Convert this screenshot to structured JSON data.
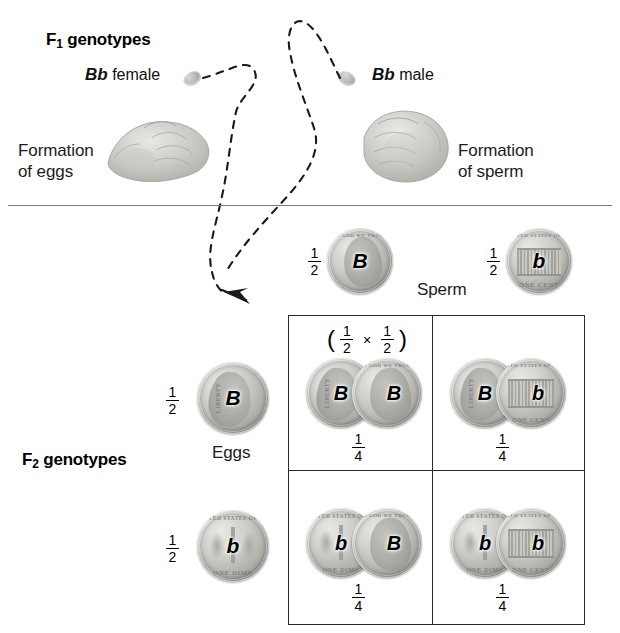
{
  "figure": {
    "type": "genetics-punnett-square",
    "title_f1": "F₁ genotypes",
    "title_f2": "F₂ genotypes"
  },
  "f1": {
    "label": "F₁ genotypes",
    "female": {
      "genotype": "Bb",
      "sex": "female",
      "caption": "Formation\nof eggs"
    },
    "male": {
      "genotype": "Bb",
      "sex": "male",
      "caption": "Formation\nof sperm"
    }
  },
  "gametes": {
    "sperm_label": "Sperm",
    "eggs_label": "Eggs",
    "sperm": [
      {
        "allele": "B",
        "probability_num": "1",
        "probability_den": "2",
        "coin": "penny-heads"
      },
      {
        "allele": "b",
        "probability_num": "1",
        "probability_den": "2",
        "coin": "penny-tails"
      }
    ],
    "eggs": [
      {
        "allele": "B",
        "probability_num": "1",
        "probability_den": "2",
        "coin": "dime-heads"
      },
      {
        "allele": "b",
        "probability_num": "1",
        "probability_den": "2",
        "coin": "dime-tails"
      }
    ]
  },
  "probability_expression": {
    "open": "(",
    "a_num": "1",
    "a_den": "2",
    "times": "×",
    "b_num": "1",
    "b_den": "2",
    "close": ")"
  },
  "f2": {
    "label": "F₂ genotypes",
    "cells": [
      {
        "row": 0,
        "col": 0,
        "egg_allele": "B",
        "sperm_allele": "B",
        "genotype": "BB",
        "egg_coin": "dime-heads",
        "sperm_coin": "penny-heads",
        "probability_num": "1",
        "probability_den": "4",
        "has_expression": true
      },
      {
        "row": 0,
        "col": 1,
        "egg_allele": "B",
        "sperm_allele": "b",
        "genotype": "Bb",
        "egg_coin": "dime-heads",
        "sperm_coin": "penny-tails",
        "probability_num": "1",
        "probability_den": "4",
        "has_expression": false
      },
      {
        "row": 1,
        "col": 0,
        "egg_allele": "b",
        "sperm_allele": "B",
        "genotype": "bB",
        "egg_coin": "dime-tails",
        "sperm_coin": "penny-heads",
        "probability_num": "1",
        "probability_den": "4",
        "has_expression": false
      },
      {
        "row": 1,
        "col": 1,
        "egg_allele": "b",
        "sperm_allele": "b",
        "genotype": "bb",
        "egg_coin": "dime-tails",
        "sperm_coin": "penny-tails",
        "probability_num": "1",
        "probability_den": "4",
        "has_expression": false
      }
    ]
  },
  "coin_legends": {
    "dime_heads_left": "LIBERTY",
    "dime_tails_top": "UNITED STATES OF AMERICA",
    "dime_tails_bottom": "ONE DIME",
    "penny_heads_top": "IN GOD WE TRUST",
    "penny_tails_top": "UNITED STATES OF AMERICA",
    "penny_tails_bottom": "ONE CENT"
  },
  "colors": {
    "ink": "#1a1a1a",
    "rule": "#7a7a7a",
    "grid": "#2a2a2a",
    "coin_light": "#e8e8e6",
    "coin_dark": "#858580"
  }
}
